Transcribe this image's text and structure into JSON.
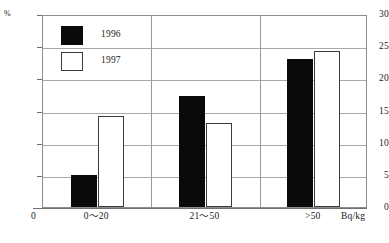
{
  "chart_data": {
    "type": "bar",
    "title": "",
    "xlabel": "Bq/kg",
    "ylabel": "%",
    "categories": [
      "0〜20",
      "21〜50",
      ">50"
    ],
    "series": [
      {
        "name": "1996",
        "color": "#0a0a0a",
        "fill": "solid-black",
        "values": [
          5.0,
          17.2,
          23.0
        ]
      },
      {
        "name": "1997",
        "color": "#ffffff",
        "fill": "white-outlined",
        "values": [
          14.2,
          13.1,
          24.2
        ]
      }
    ],
    "ylim": [
      0,
      30
    ],
    "ytick_step": 5,
    "yticks": [
      "0",
      "5",
      "10",
      "15",
      "20",
      "25",
      "30"
    ],
    "grid": true,
    "legend_position": "inside-top-left",
    "x_origin_label": "0",
    "y_unit_label": "%",
    "x_unit_label": "Bq/kg"
  },
  "legend": {
    "entries": [
      {
        "label": "1996"
      },
      {
        "label": "1997"
      }
    ]
  },
  "axes": {
    "y_unit": "%",
    "x_origin": "0",
    "x_unit": "Bq/kg"
  }
}
